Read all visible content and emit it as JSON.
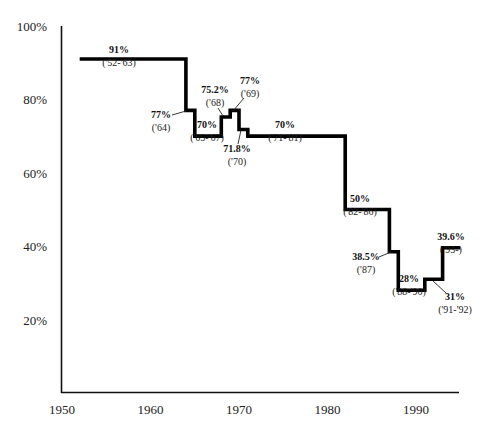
{
  "chart_data": {
    "type": "line",
    "subtype": "step",
    "title": "",
    "xlabel": "",
    "ylabel": "",
    "xlim": [
      1950,
      1996
    ],
    "ylim": [
      0,
      100
    ],
    "grid": false,
    "legend": null,
    "x_ticks": [
      "1950",
      "1960",
      "1970",
      "1980",
      "1990"
    ],
    "y_ticks": [
      "20%",
      "40%",
      "60%",
      "80%",
      "100%"
    ],
    "series": [
      {
        "name": "Top rate",
        "steps": [
          {
            "start": 1952,
            "end": 1964,
            "value": 91,
            "label": "91%",
            "period": "('52-'63)"
          },
          {
            "start": 1964,
            "end": 1965,
            "value": 77,
            "label": "77%",
            "period": "('64)"
          },
          {
            "start": 1965,
            "end": 1968,
            "value": 70,
            "label": "70%",
            "period": "('65-'67)"
          },
          {
            "start": 1968,
            "end": 1969,
            "value": 75.2,
            "label": "75.2%",
            "period": "('68)"
          },
          {
            "start": 1969,
            "end": 1970,
            "value": 77,
            "label": "77%",
            "period": "('69)"
          },
          {
            "start": 1970,
            "end": 1971,
            "value": 71.8,
            "label": "71.8%",
            "period": "('70)"
          },
          {
            "start": 1971,
            "end": 1982,
            "value": 70,
            "label": "70%",
            "period": "('71-'81)"
          },
          {
            "start": 1982,
            "end": 1987,
            "value": 50,
            "label": "50%",
            "period": "('82-'86)"
          },
          {
            "start": 1987,
            "end": 1988,
            "value": 38.5,
            "label": "38.5%",
            "period": "('87)"
          },
          {
            "start": 1988,
            "end": 1991,
            "value": 28,
            "label": "28%",
            "period": "('88-'90)"
          },
          {
            "start": 1991,
            "end": 1993,
            "value": 31,
            "label": "31%",
            "period": "('91-'92)"
          },
          {
            "start": 1993,
            "end": 1995,
            "value": 39.6,
            "label": "39.6%",
            "period": "('93-)"
          }
        ]
      }
    ],
    "annotations": [
      {
        "text": "91%",
        "sub": "('52-'63)",
        "x": 119,
        "y": 53,
        "leader": null
      },
      {
        "text": "77%",
        "sub": "('64)",
        "x": 161,
        "y": 118,
        "leader": [
          172,
          115,
          186,
          111
        ]
      },
      {
        "text": "70%",
        "sub": "('65-'67)",
        "x": 207,
        "y": 128,
        "leader": null
      },
      {
        "text": "75.2%",
        "sub": "('68)",
        "x": 215,
        "y": 93,
        "leader": [
          218,
          108,
          223,
          116
        ]
      },
      {
        "text": "77%",
        "sub": "('69)",
        "x": 250,
        "y": 84,
        "leader": [
          244,
          98,
          233,
          111
        ]
      },
      {
        "text": "71.8%",
        "sub": "('70)",
        "x": 237,
        "y": 152,
        "leader": [
          241,
          130,
          238,
          144
        ]
      },
      {
        "text": "70%",
        "sub": "('71-'81)",
        "x": 285,
        "y": 128,
        "leader": null
      },
      {
        "text": "50%",
        "sub": "('82-'86)",
        "x": 360,
        "y": 202,
        "leader": null
      },
      {
        "text": "38.5%",
        "sub": "('87)",
        "x": 366,
        "y": 260,
        "leader": [
          379,
          257,
          391,
          252
        ]
      },
      {
        "text": "28%",
        "sub": "('88-'90)",
        "x": 409,
        "y": 282,
        "leader": null
      },
      {
        "text": "31%",
        "sub": "('91-'92)",
        "x": 455,
        "y": 300,
        "leader": [
          433,
          281,
          446,
          293
        ]
      },
      {
        "text": "39.6%",
        "sub": "('93-)",
        "x": 451,
        "y": 240,
        "leader": null
      }
    ]
  }
}
